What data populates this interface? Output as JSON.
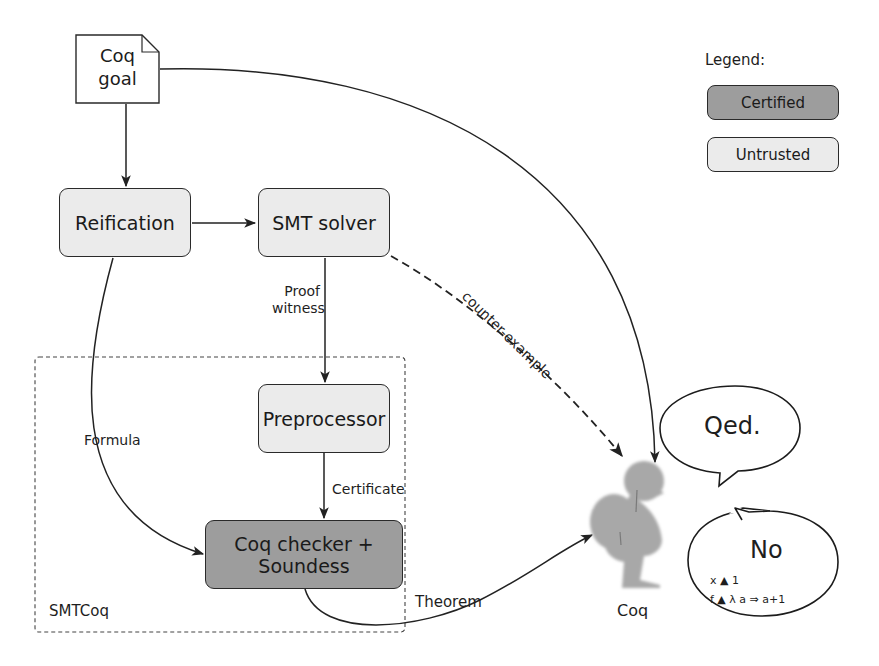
{
  "diagram": {
    "colors": {
      "certified_fill": "#9d9d9d",
      "untrusted_fill": "#ebebeb",
      "stroke": "#2a2a2a",
      "rooster": "#a8a8a8"
    },
    "nodes": {
      "coq_goal": {
        "line1": "Coq",
        "line2": "goal",
        "shape": "document"
      },
      "reification": {
        "label": "Reification",
        "kind": "untrusted"
      },
      "smt_solver": {
        "label": "SMT solver",
        "kind": "untrusted"
      },
      "preprocessor": {
        "label": "Preprocessor",
        "kind": "untrusted"
      },
      "coq_checker": {
        "label": "Coq checker + Soundess",
        "kind": "certified"
      },
      "coq": {
        "label": "Coq",
        "icon": "rooster-icon"
      }
    },
    "container": {
      "label": "SMTCoq",
      "style": "dashed"
    },
    "edges": {
      "proof_witness_1": "Proof",
      "proof_witness_2": "witness",
      "formula": "Formula",
      "certificate": "Certificate",
      "theorem": "Theorem",
      "counter_example": "counter-example"
    },
    "bubbles": {
      "qed": {
        "title": "Qed."
      },
      "no": {
        "title": "No",
        "line1": "x ▲ 1",
        "line2": "f ▲ λ a ⇒ a+1"
      }
    },
    "legend": {
      "title": "Legend:",
      "certified": "Certified",
      "untrusted": "Untrusted"
    }
  }
}
